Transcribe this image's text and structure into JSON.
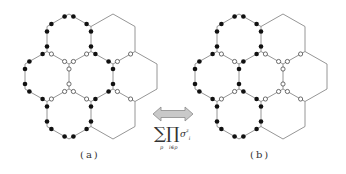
{
  "figure": {
    "panels": [
      {
        "id": "a",
        "label": "(a)",
        "offset_x": 0,
        "enclosed_cells": [
          0,
          2,
          3,
          5
        ],
        "open_edges": [
          [
            47,
            51.5,
            69,
            64
          ],
          [
            69,
            64,
            91,
            51.5
          ],
          [
            69,
            64,
            69,
            89
          ],
          [
            69,
            89,
            47,
            101.5
          ],
          [
            69,
            89,
            91,
            101.5
          ],
          [
            113,
            64,
            135,
            51.5
          ],
          [
            113,
            89,
            135,
            101.5
          ]
        ]
      },
      {
        "id": "b",
        "label": "(b)",
        "offset_x": 170,
        "enclosed_cells": [
          0,
          2,
          5
        ],
        "open_edges": [
          [
            47,
            51.5,
            69,
            64
          ],
          [
            69,
            89,
            47,
            101.5
          ],
          [
            91,
            51.5,
            113,
            64
          ],
          [
            113,
            64,
            135,
            51.5
          ],
          [
            113,
            64,
            113,
            89
          ],
          [
            113,
            89,
            91,
            101.5
          ],
          [
            113,
            89,
            135,
            101.5
          ]
        ]
      }
    ],
    "lattice": {
      "cells": [
        [
          69,
          39
        ],
        [
          113,
          39
        ],
        [
          47,
          76.5
        ],
        [
          91,
          76.5
        ],
        [
          135,
          76.5
        ],
        [
          69,
          114
        ],
        [
          113,
          114
        ]
      ],
      "half_width": 22,
      "half_height": 25,
      "line_color": "#8a8a8a",
      "dot_color": "#111111"
    },
    "arrow": {
      "fill": "#c9c9c9",
      "stroke": "#8a8a8a"
    },
    "formula": {
      "sum": "∑",
      "prod": "∏",
      "sigma": "σ",
      "sigma_sup": "z",
      "sigma_sub": "i",
      "sum_sub": "p",
      "prod_sub": "i∈p"
    }
  }
}
